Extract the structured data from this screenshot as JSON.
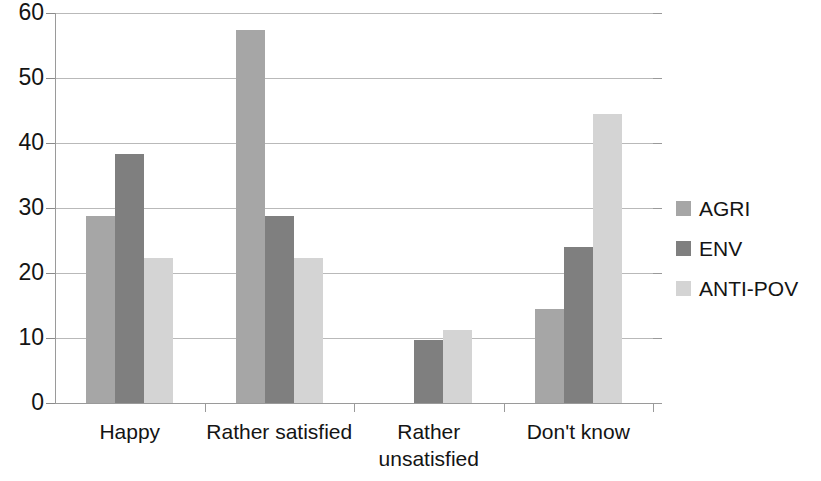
{
  "chart_data": {
    "type": "bar",
    "title": "",
    "subtitle": "",
    "xlabel": "",
    "ylabel": "",
    "categories": [
      "Happy",
      "Rather satisfied",
      "Rather unsatisfied",
      "Don't know"
    ],
    "category_label_lines": [
      [
        "Happy"
      ],
      [
        "Rather satisfied"
      ],
      [
        "Rather",
        "unsatisfied"
      ],
      [
        "Don't know"
      ]
    ],
    "series": [
      {
        "name": "AGRI",
        "color": "#a6a6a6",
        "values": [
          28.8,
          57.4,
          0,
          14.5
        ]
      },
      {
        "name": "ENV",
        "color": "#7f7f7f",
        "values": [
          38.3,
          28.8,
          9.7,
          24.0
        ]
      },
      {
        "name": "ANTI-POV",
        "color": "#d4d4d4",
        "values": [
          22.3,
          22.3,
          11.3,
          44.5
        ]
      }
    ],
    "ylim": [
      0,
      60
    ],
    "y_ticks": [
      0,
      10,
      20,
      30,
      40,
      50,
      60
    ],
    "y_tick_labels": [
      "0",
      "10",
      "20",
      "30",
      "40",
      "50",
      "60"
    ],
    "grid": true,
    "grid_axis": "y",
    "legend_position": "right",
    "bar_orientation": "vertical",
    "grouping": "clustered"
  },
  "legend": {
    "entries": [
      {
        "label": "AGRI",
        "color": "#a6a6a6"
      },
      {
        "label": "ENV",
        "color": "#7f7f7f"
      },
      {
        "label": "ANTI-POV",
        "color": "#d4d4d4"
      }
    ]
  },
  "axis": {
    "y_labels": [
      "60",
      "50",
      "40",
      "30",
      "20",
      "10",
      "0"
    ],
    "x_labels": [
      "Happy",
      "Rather satisfied",
      "Rather unsatisfied",
      "Don't know"
    ]
  }
}
